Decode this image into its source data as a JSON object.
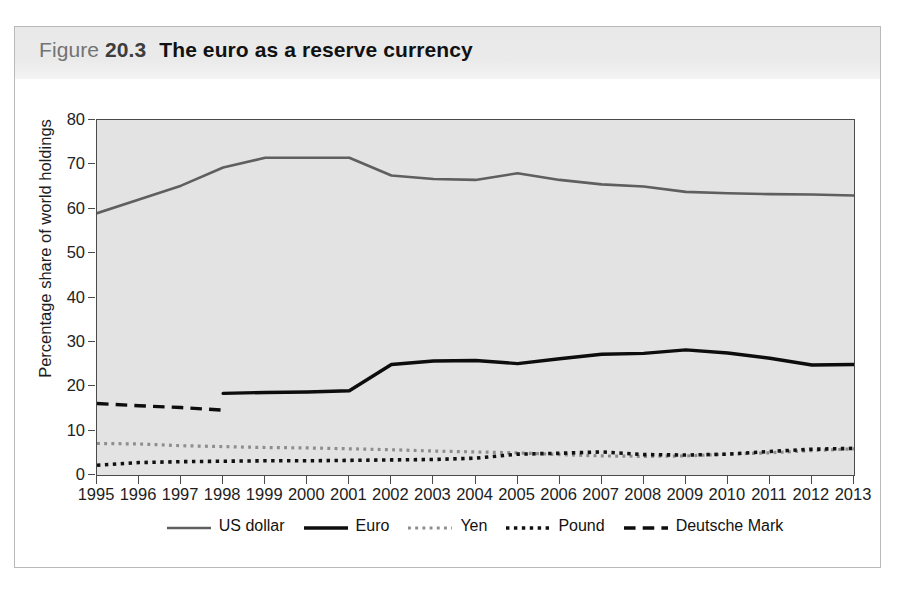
{
  "figure": {
    "label": "Figure",
    "number": "20.3",
    "name": "The euro as a reserve currency"
  },
  "chart_data": {
    "type": "line",
    "title": "The euro as a reserve currency",
    "xlabel": "",
    "ylabel": "Percentage share of world holdings",
    "xlim": [
      1995,
      2013
    ],
    "ylim": [
      0,
      80
    ],
    "yticks": [
      0,
      10,
      20,
      30,
      40,
      50,
      60,
      70,
      80
    ],
    "grid": false,
    "legend_position": "bottom",
    "plot_background": "#e3e3e3",
    "x": [
      1995,
      1996,
      1997,
      1998,
      1999,
      2000,
      2001,
      2002,
      2003,
      2004,
      2005,
      2006,
      2007,
      2008,
      2009,
      2010,
      2011,
      2012,
      2013
    ],
    "categories": [
      "1995",
      "1996",
      "1997",
      "1998",
      "1999",
      "2000",
      "2001",
      "2002",
      "2003",
      "2004",
      "2005",
      "2006",
      "2007",
      "2008",
      "2009",
      "2010",
      "2011",
      "2012",
      "2013"
    ],
    "series": [
      {
        "name": "US dollar",
        "style": "solid",
        "color": "#5f5f5f",
        "width": 2.6,
        "values": [
          59.0,
          62.1,
          65.2,
          69.3,
          71.5,
          71.5,
          71.5,
          67.5,
          66.7,
          66.5,
          68.0,
          66.5,
          65.5,
          65.0,
          63.8,
          63.5,
          63.3,
          63.2,
          63.0
        ]
      },
      {
        "name": "Euro",
        "style": "solid",
        "color": "#0d0d0d",
        "width": 3.4,
        "values": [
          null,
          null,
          null,
          18.4,
          18.6,
          18.7,
          19.0,
          24.9,
          25.7,
          25.8,
          25.1,
          26.2,
          27.2,
          27.4,
          28.2,
          27.5,
          26.3,
          24.8,
          24.9
        ]
      },
      {
        "name": "Yen",
        "style": "fine-dotted",
        "color": "#8d8d8d",
        "width": 3.2,
        "values": [
          7.1,
          7.0,
          6.6,
          6.4,
          6.2,
          6.1,
          5.9,
          5.7,
          5.4,
          5.2,
          5.0,
          4.6,
          4.3,
          4.2,
          4.3,
          4.7,
          5.0,
          5.5,
          5.9
        ]
      },
      {
        "name": "Pound",
        "style": "dotted",
        "color": "#111111",
        "width": 3.6,
        "values": [
          2.2,
          2.8,
          3.0,
          3.1,
          3.2,
          3.2,
          3.3,
          3.4,
          3.5,
          3.8,
          4.7,
          4.9,
          5.2,
          4.6,
          4.5,
          4.7,
          5.3,
          5.8,
          6.0
        ]
      },
      {
        "name": "Deutsche Mark",
        "style": "dashed",
        "color": "#0d0d0d",
        "width": 3.4,
        "values": [
          16.1,
          15.6,
          15.2,
          14.6,
          null,
          null,
          null,
          null,
          null,
          null,
          null,
          null,
          null,
          null,
          null,
          null,
          null,
          null,
          null
        ]
      }
    ]
  },
  "legend": {
    "items": [
      {
        "label": "US dollar",
        "swatch": "solid-gray-line"
      },
      {
        "label": "Euro",
        "swatch": "solid-black-line"
      },
      {
        "label": "Yen",
        "swatch": "gray-dotted-line"
      },
      {
        "label": "Pound",
        "swatch": "black-dotted-line"
      },
      {
        "label": "Deutsche Mark",
        "swatch": "black-dashed-line"
      }
    ]
  }
}
